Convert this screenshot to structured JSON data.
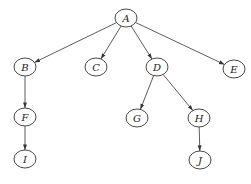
{
  "diagram": {
    "type": "tree",
    "directed": true,
    "colors": {
      "stroke": "#333333",
      "fill": "#ffffff",
      "text": "#222222"
    },
    "nodes": [
      {
        "id": "A",
        "label": "A",
        "x": 126,
        "y": 18
      },
      {
        "id": "B",
        "label": "B",
        "x": 25,
        "y": 67
      },
      {
        "id": "C",
        "label": "C",
        "x": 96,
        "y": 67
      },
      {
        "id": "D",
        "label": "D",
        "x": 157,
        "y": 67
      },
      {
        "id": "E",
        "label": "E",
        "x": 234,
        "y": 69
      },
      {
        "id": "F",
        "label": "F",
        "x": 25,
        "y": 117
      },
      {
        "id": "G",
        "label": "G",
        "x": 137,
        "y": 118
      },
      {
        "id": "H",
        "label": "H",
        "x": 199,
        "y": 118
      },
      {
        "id": "I",
        "label": "I",
        "x": 25,
        "y": 159
      },
      {
        "id": "J",
        "label": "J",
        "x": 200,
        "y": 160
      }
    ],
    "edges": [
      {
        "from": "A",
        "to": "B"
      },
      {
        "from": "A",
        "to": "C"
      },
      {
        "from": "A",
        "to": "D"
      },
      {
        "from": "A",
        "to": "E"
      },
      {
        "from": "B",
        "to": "F"
      },
      {
        "from": "F",
        "to": "I"
      },
      {
        "from": "D",
        "to": "G"
      },
      {
        "from": "D",
        "to": "H"
      },
      {
        "from": "H",
        "to": "J"
      }
    ]
  }
}
